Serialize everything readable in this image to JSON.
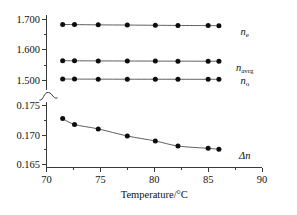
{
  "chart_data": {
    "type": "line",
    "title": "",
    "subtitle": "",
    "xlabel": "Temperature/°C",
    "ylabel": "",
    "xlim": [
      70,
      90
    ],
    "x_ticks": [
      70,
      75,
      80,
      85,
      90
    ],
    "x_tick_labels": [
      "70",
      "75",
      "80",
      "85",
      "90"
    ],
    "x_minor_ticks": [
      72.5,
      77.5,
      82.5,
      87.5
    ],
    "broken_axis": true,
    "axis_break_symbol": "squiggle",
    "upper_panel": {
      "ylim": [
        1.47,
        1.715
      ],
      "y_ticks": [
        1.5,
        1.6,
        1.7
      ],
      "y_tick_labels": [
        "1.500",
        "1.600",
        "1.700"
      ],
      "y_minor_ticks": [
        1.55,
        1.65
      ]
    },
    "lower_panel": {
      "ylim": [
        0.1645,
        0.1757
      ],
      "y_ticks": [
        0.165,
        0.17,
        0.175
      ],
      "y_tick_labels": [
        "0.165",
        "0.170",
        "0.175"
      ],
      "y_minor_ticks": [
        0.1675,
        0.1725
      ]
    },
    "x": [
      71.5,
      72.6,
      74.8,
      77.5,
      80.1,
      82.2,
      85.0,
      86.0
    ],
    "grid": false,
    "legend_position": "right-inline",
    "marker": "filled-circle",
    "series": [
      {
        "name": "n_e",
        "label": "n",
        "label_sub": "e",
        "panel": "upper",
        "values": [
          1.6825,
          1.682,
          1.6812,
          1.6805,
          1.6798,
          1.6792,
          1.6788,
          1.6786
        ],
        "label_x": 88.4,
        "label_y": 1.648
      },
      {
        "name": "n_avrg",
        "label": "n",
        "label_sub": "avrg",
        "panel": "upper",
        "values": [
          1.564,
          1.5638,
          1.5634,
          1.5631,
          1.5628,
          1.5626,
          1.5624,
          1.5623
        ],
        "label_x": 88.4,
        "label_y": 1.532
      },
      {
        "name": "n_o",
        "label": "n",
        "label_sub": "o",
        "panel": "upper",
        "values": [
          1.5042,
          1.504,
          1.5038,
          1.5036,
          1.5035,
          1.5034,
          1.5033,
          1.5033
        ],
        "label_x": 88.4,
        "label_y": 1.487
      },
      {
        "name": "delta_n",
        "label": "Δn",
        "label_sub": "",
        "panel": "lower",
        "values": [
          0.1728,
          0.1718,
          0.17105,
          0.16985,
          0.169,
          0.16815,
          0.16775,
          0.1676
        ],
        "label_x": 88.4,
        "label_y": 0.166
      }
    ]
  }
}
